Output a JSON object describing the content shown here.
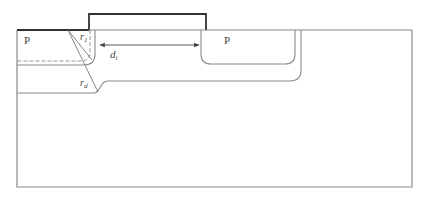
{
  "diagram": {
    "type": "semiconductor cross-section",
    "labels": {
      "left_region": "P",
      "right_region": "P",
      "radius_1": "r",
      "radius_1_sub": "1",
      "radius_d": "r",
      "radius_d_sub": "d",
      "distance": "d",
      "distance_sub": "i"
    },
    "colors": {
      "line": "#8a8a8a",
      "thick_line": "#333333",
      "text": "#444444",
      "background": "#ffffff"
    }
  }
}
